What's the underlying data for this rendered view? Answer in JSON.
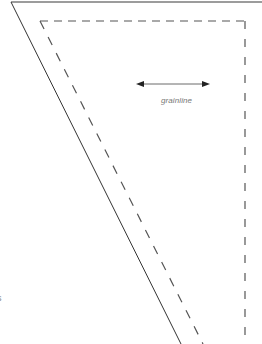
{
  "pattern_piece": {
    "grainline": {
      "label": "grainline",
      "arrow": "double-headed-arrow"
    },
    "edge_text": "s",
    "lines": {
      "cut_line": "solid",
      "seam_line": "dashed"
    },
    "colors": {
      "background": "#ffffff",
      "cut_line": "#333333",
      "seam_line": "#555555",
      "label": "#777777"
    }
  }
}
